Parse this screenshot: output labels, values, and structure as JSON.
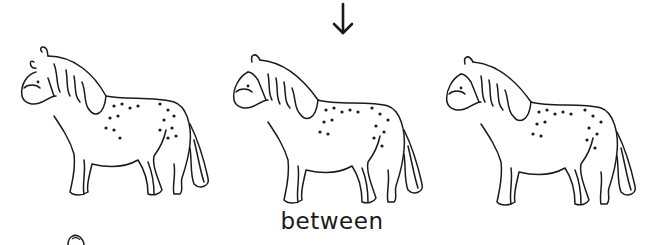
{
  "illustration": {
    "word": "between",
    "pointer": {
      "icon": "arrow-down-icon",
      "target": "middle-horse"
    },
    "horses": [
      {
        "position": "left",
        "description": "spotted horse, facing left"
      },
      {
        "position": "middle",
        "description": "spotted horse, facing left, indicated by arrow"
      },
      {
        "position": "right",
        "description": "spotted horse, facing left"
      }
    ],
    "colors": {
      "ink": "#1a1a1a",
      "background": "#ffffff"
    }
  }
}
